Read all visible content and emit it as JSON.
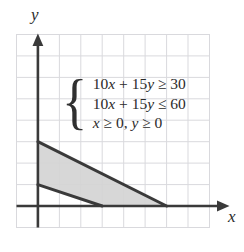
{
  "figure": {
    "axis_labels": {
      "x": "x",
      "y": "y"
    },
    "system": {
      "brace": "{",
      "lines": [
        "10x + 15y ≥ 30",
        "10x + 15y ≤ 60",
        "x ≥ 0, y ≥ 0"
      ]
    },
    "colors": {
      "grid": "#d9d9dd",
      "grid_border": "#d9d9dd",
      "axis": "#3a3a3a",
      "boundary_line": "#3a3a3a",
      "shading": "#d4d4d4",
      "text": "#2b2b2b",
      "background": "#ffffff"
    }
  },
  "chart_data": {
    "type": "area",
    "title": "",
    "xlabel": "x",
    "ylabel": "y",
    "grid": true,
    "legend": "none",
    "xlim": [
      -0.75,
      8.25
    ],
    "ylim": [
      -0.75,
      8.25
    ],
    "xticks": [
      -1,
      0,
      1,
      2,
      3,
      4,
      5,
      6,
      7,
      8
    ],
    "yticks": [
      -1,
      0,
      1,
      2,
      3,
      4,
      5,
      6,
      7,
      8
    ],
    "tick_labels_shown": false,
    "annotations": [
      "10x + 15y ≥ 30",
      "10x + 15y ≤ 60",
      "x ≥ 0, y ≥ 0"
    ],
    "series": [
      {
        "name": "10x + 15y = 30",
        "type": "line",
        "points": [
          [
            0,
            2
          ],
          [
            3,
            0
          ]
        ]
      },
      {
        "name": "10x + 15y = 60",
        "type": "line",
        "points": [
          [
            0,
            4
          ],
          [
            6,
            0
          ]
        ]
      },
      {
        "name": "feasible region",
        "type": "polygon",
        "fill": "#d4d4d4",
        "vertices": [
          [
            0,
            2
          ],
          [
            0,
            4
          ],
          [
            6,
            0
          ],
          [
            3,
            0
          ]
        ]
      }
    ]
  }
}
